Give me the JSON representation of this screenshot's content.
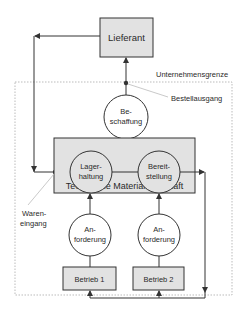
{
  "diagram": {
    "colors": {
      "line": "#333333",
      "box_fill": "#e2e2e2",
      "boundary": "#aaaaaa",
      "annotation_line": "#bbbbbb"
    },
    "supplier": {
      "label": "Lieferant"
    },
    "boundary_label": "Unternehmensgrenze",
    "order_output_label": "Bestellausgang",
    "goods_receipt_label": {
      "line1": "Waren-",
      "line2": "eingang"
    },
    "procurement": {
      "line1": "Be-",
      "line2": "schaffung"
    },
    "technical_materials_management": {
      "label": "Technische Materialwirtschaft",
      "storage": {
        "line1": "Lager-",
        "line2": "haltung"
      },
      "provision": {
        "line1": "Bereit-",
        "line2": "stellung"
      }
    },
    "requests": [
      {
        "line1": "An-",
        "line2": "forderung"
      },
      {
        "line1": "An-",
        "line2": "forderung"
      }
    ],
    "plants": [
      {
        "label": "Betrieb 1"
      },
      {
        "label": "Betrieb 2"
      }
    ]
  }
}
